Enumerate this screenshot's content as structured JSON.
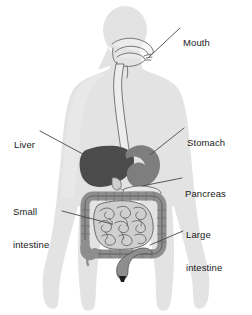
{
  "figure": {
    "kind": "anatomical-diagram",
    "background_color": "#ffffff"
  },
  "colors": {
    "body_silhouette": "#e3e3e3",
    "body_silhouette_edge": "#d8d8d8",
    "liver": "#4b4b4b",
    "stomach": "#7e7e7e",
    "pancreas": "#e8e8e8",
    "intestine_fill": "#a8a8a8",
    "small_intestine_fill": "#cfcfcf",
    "esophagus_fill": "#ededed",
    "outline": "#555555",
    "anus": "#1c1c1c",
    "leader_line": "#4a4a4a",
    "label_text": "#1a1a1a"
  },
  "labels": [
    {
      "id": "mouth",
      "text": "Mouth",
      "lines": [
        "Mouth"
      ],
      "side": "right",
      "x": 183,
      "y": 20
    },
    {
      "id": "stomach",
      "text": "Stomach",
      "lines": [
        "Stomach"
      ],
      "side": "right",
      "x": 187,
      "y": 120
    },
    {
      "id": "pancreas",
      "text": "Pancreas",
      "lines": [
        "Pancreas"
      ],
      "side": "right",
      "x": 185,
      "y": 171
    },
    {
      "id": "large-intestine",
      "text": "Large intestine",
      "lines": [
        "Large",
        "intestine"
      ],
      "side": "right",
      "x": 186,
      "y": 212
    },
    {
      "id": "liver",
      "text": "Liver",
      "lines": [
        "Liver"
      ],
      "side": "left",
      "x": 14,
      "y": 122
    },
    {
      "id": "small-intestine",
      "text": "Small intestine",
      "lines": [
        "Small",
        "intestine"
      ],
      "side": "left",
      "x": 13,
      "y": 189
    }
  ],
  "leader_lines": [
    {
      "id": "mouth-leader",
      "x1": 180,
      "y1": 28,
      "x2": 148,
      "y2": 58
    },
    {
      "id": "stomach-leader",
      "x1": 184,
      "y1": 128,
      "x2": 150,
      "y2": 155
    },
    {
      "id": "pancreas-leader",
      "x1": 182,
      "y1": 178,
      "x2": 142,
      "y2": 186
    },
    {
      "id": "large-intestine-leader",
      "x1": 183,
      "y1": 231,
      "x2": 150,
      "y2": 245
    },
    {
      "id": "liver-leader",
      "x1": 40,
      "y1": 131,
      "x2": 94,
      "y2": 160
    },
    {
      "id": "small-intestine-leader",
      "x1": 62,
      "y1": 211,
      "x2": 112,
      "y2": 224
    }
  ],
  "organs": [
    {
      "id": "body",
      "name": "body-silhouette",
      "interactable": false
    },
    {
      "id": "mouth-cavity",
      "name": "mouth-organ",
      "interactable": false
    },
    {
      "id": "esophagus",
      "name": "esophagus-organ",
      "interactable": false
    },
    {
      "id": "liver",
      "name": "liver-organ",
      "interactable": false
    },
    {
      "id": "stomach",
      "name": "stomach-organ",
      "interactable": false
    },
    {
      "id": "pancreas",
      "name": "pancreas-organ",
      "interactable": false
    },
    {
      "id": "large-intestine",
      "name": "large-intestine-organ",
      "interactable": false
    },
    {
      "id": "small-intestine",
      "name": "small-intestine-organ",
      "interactable": false
    },
    {
      "id": "rectum",
      "name": "rectum-organ",
      "interactable": false
    },
    {
      "id": "anus",
      "name": "anus-marker",
      "interactable": false
    }
  ]
}
